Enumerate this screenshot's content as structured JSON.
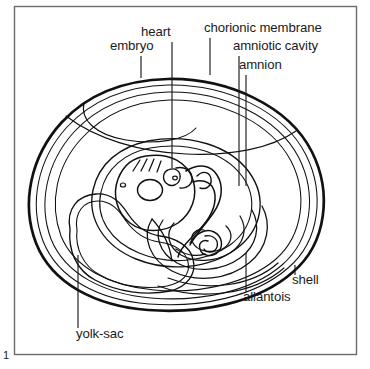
{
  "figure": {
    "number": "1",
    "frame": {
      "border_color": "#6b6b6b",
      "x": 14,
      "y": 6,
      "width": 343,
      "height": 349
    },
    "ink_color": "#111111",
    "background_color": "#ffffff"
  },
  "labels": [
    {
      "id": "embryo",
      "text": "embryo",
      "text_x": 110,
      "text_y": 50,
      "anchor": "start",
      "leader": {
        "x1": 141,
        "y1": 56,
        "x2": 141,
        "y2": 78
      }
    },
    {
      "id": "heart",
      "text": "heart",
      "text_x": 141,
      "text_y": 36,
      "anchor": "start",
      "leader": {
        "x1": 172,
        "y1": 42,
        "x2": 172,
        "y2": 168
      }
    },
    {
      "id": "chorionic-membrane",
      "text": "chorionic membrane",
      "text_x": 204,
      "text_y": 32,
      "anchor": "start",
      "leader": {
        "x1": 210,
        "y1": 38,
        "x2": 210,
        "y2": 75
      }
    },
    {
      "id": "amniotic-cavity",
      "text": "amniotic cavity",
      "text_x": 233,
      "text_y": 50,
      "anchor": "start",
      "leader": {
        "x1": 239,
        "y1": 56,
        "x2": 239,
        "y2": 186
      }
    },
    {
      "id": "amnion",
      "text": "amnion",
      "text_x": 239,
      "text_y": 69,
      "anchor": "start",
      "leader": {
        "x1": 246,
        "y1": 75,
        "x2": 246,
        "y2": 186
      }
    },
    {
      "id": "shell",
      "text": "shell",
      "text_x": 292,
      "text_y": 284,
      "anchor": "start",
      "leader": {
        "x1": 295,
        "y1": 265,
        "x2": 295,
        "y2": 275
      }
    },
    {
      "id": "allantois",
      "text": "allantois",
      "text_x": 243,
      "text_y": 301,
      "anchor": "start",
      "leader": {
        "x1": 246,
        "y1": 253,
        "x2": 246,
        "y2": 292
      }
    },
    {
      "id": "yolk-sac",
      "text": "yolk-sac",
      "text_x": 76,
      "text_y": 338,
      "anchor": "start",
      "leader": {
        "x1": 78,
        "y1": 255,
        "x2": 78,
        "y2": 328
      }
    }
  ],
  "structures": [
    {
      "id": "shell",
      "label": "shell",
      "stroke_width": 2.6
    },
    {
      "id": "shell-membrane",
      "label": "shell membrane",
      "stroke_width": 1.0
    },
    {
      "id": "chorionic-membrane",
      "label": "chorionic membrane",
      "stroke_width": 1.0
    },
    {
      "id": "amnion",
      "label": "amnion",
      "stroke_width": 1.0
    },
    {
      "id": "amniotic-cavity",
      "label": "amniotic cavity",
      "stroke_width": 1.0
    },
    {
      "id": "embryo",
      "label": "embryo",
      "stroke_width": 1.3
    },
    {
      "id": "yolk-sac",
      "label": "yolk-sac",
      "stroke_width": 1.2
    },
    {
      "id": "allantois",
      "label": "allantois",
      "stroke_width": 1.2
    },
    {
      "id": "heart",
      "label": "heart",
      "stroke_width": 1.2
    }
  ]
}
